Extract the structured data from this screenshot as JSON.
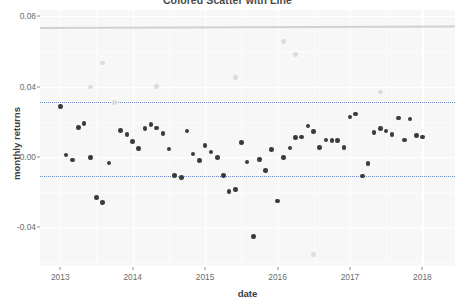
{
  "chart_data": {
    "type": "scatter",
    "title": "Colored Scatter with Line",
    "xlabel": "date",
    "ylabel": "monthly returns",
    "xlim": [
      2012.72,
      2018.45
    ],
    "ylim": [
      -0.062,
      0.0835
    ],
    "grid": true,
    "legend": "none",
    "xticks": [
      2013,
      2014,
      2015,
      2016,
      2017,
      2018
    ],
    "xticklabels": [
      "2013",
      "2014",
      "2015",
      "2016",
      "2017",
      "2018"
    ],
    "yticks": [
      0.08,
      0.04,
      0.0,
      -0.04
    ],
    "yticklabels": [
      "0.08",
      "0.04",
      "0.00",
      "-0.04"
    ],
    "annotations": [
      {
        "type": "hline",
        "label": "upper band",
        "y": 0.0312,
        "style": "dotted",
        "color": "#5f7fbf"
      },
      {
        "type": "hline",
        "label": "lower band",
        "y": -0.0108,
        "style": "dotted",
        "color": "#5f7fbf"
      },
      {
        "type": "trendline",
        "label": "fitted line",
        "y0": 0.0738,
        "y1": 0.0746,
        "color": "#cfcfcf"
      }
    ],
    "series": [
      {
        "name": "in-band returns",
        "color": "#3b3b3b",
        "marker": "circle",
        "points": [
          {
            "x": 2013.0,
            "y": 0.0288
          },
          {
            "x": 2013.08,
            "y": 0.0012
          },
          {
            "x": 2013.17,
            "y": -0.0018
          },
          {
            "x": 2013.25,
            "y": 0.0168
          },
          {
            "x": 2013.33,
            "y": 0.019
          },
          {
            "x": 2013.42,
            "y": -0.0005
          },
          {
            "x": 2013.5,
            "y": -0.0232
          },
          {
            "x": 2013.58,
            "y": -0.0258
          },
          {
            "x": 2013.67,
            "y": -0.0035
          },
          {
            "x": 2013.83,
            "y": 0.0151
          },
          {
            "x": 2013.92,
            "y": 0.0126
          },
          {
            "x": 2014.0,
            "y": 0.0089
          },
          {
            "x": 2014.08,
            "y": 0.0049
          },
          {
            "x": 2014.17,
            "y": 0.016
          },
          {
            "x": 2014.25,
            "y": 0.0183
          },
          {
            "x": 2014.33,
            "y": 0.0164
          },
          {
            "x": 2014.42,
            "y": 0.0132
          },
          {
            "x": 2014.5,
            "y": 0.0046
          },
          {
            "x": 2014.58,
            "y": -0.0106
          },
          {
            "x": 2014.67,
            "y": -0.0118
          },
          {
            "x": 2014.75,
            "y": 0.0148
          },
          {
            "x": 2014.83,
            "y": 0.0017
          },
          {
            "x": 2014.92,
            "y": -0.0019
          },
          {
            "x": 2015.0,
            "y": 0.0064
          },
          {
            "x": 2015.08,
            "y": 0.0027
          },
          {
            "x": 2015.17,
            "y": -0.0005
          },
          {
            "x": 2015.25,
            "y": -0.0107
          },
          {
            "x": 2015.33,
            "y": -0.0198
          },
          {
            "x": 2015.42,
            "y": -0.0186
          },
          {
            "x": 2015.5,
            "y": 0.0081
          },
          {
            "x": 2015.58,
            "y": -0.003
          },
          {
            "x": 2015.67,
            "y": -0.0452
          },
          {
            "x": 2015.75,
            "y": -0.0015
          },
          {
            "x": 2015.83,
            "y": -0.0078
          },
          {
            "x": 2015.92,
            "y": 0.0043
          },
          {
            "x": 2016.0,
            "y": -0.0251
          },
          {
            "x": 2016.08,
            "y": -0.0004
          },
          {
            "x": 2016.17,
            "y": 0.0051
          },
          {
            "x": 2016.25,
            "y": 0.0112
          },
          {
            "x": 2016.33,
            "y": 0.0114
          },
          {
            "x": 2016.42,
            "y": 0.0175
          },
          {
            "x": 2016.5,
            "y": 0.0145
          },
          {
            "x": 2016.58,
            "y": 0.0055
          },
          {
            "x": 2016.67,
            "y": 0.0096
          },
          {
            "x": 2016.75,
            "y": 0.0094
          },
          {
            "x": 2016.83,
            "y": 0.0093
          },
          {
            "x": 2016.92,
            "y": 0.0052
          },
          {
            "x": 2017.0,
            "y": 0.0228
          },
          {
            "x": 2017.08,
            "y": 0.0245
          },
          {
            "x": 2017.17,
            "y": -0.0108
          },
          {
            "x": 2017.25,
            "y": -0.0037
          },
          {
            "x": 2017.33,
            "y": 0.014
          },
          {
            "x": 2017.42,
            "y": 0.0162
          },
          {
            "x": 2017.5,
            "y": 0.0148
          },
          {
            "x": 2017.58,
            "y": 0.0126
          },
          {
            "x": 2017.67,
            "y": 0.0222
          },
          {
            "x": 2017.75,
            "y": 0.0096
          },
          {
            "x": 2017.83,
            "y": 0.0215
          },
          {
            "x": 2017.92,
            "y": 0.0123
          },
          {
            "x": 2018.0,
            "y": 0.0114
          }
        ]
      },
      {
        "name": "out-of-band returns",
        "color": "#dcdcdc",
        "marker": "circle",
        "points": [
          {
            "x": 2013.42,
            "y": 0.0398
          },
          {
            "x": 2013.58,
            "y": 0.0534
          },
          {
            "x": 2013.75,
            "y": 0.0308
          },
          {
            "x": 2014.33,
            "y": 0.04
          },
          {
            "x": 2015.42,
            "y": 0.045
          },
          {
            "x": 2016.08,
            "y": 0.0655
          },
          {
            "x": 2016.25,
            "y": 0.0583
          },
          {
            "x": 2016.5,
            "y": -0.0555
          },
          {
            "x": 2017.42,
            "y": 0.0368
          }
        ]
      }
    ]
  }
}
